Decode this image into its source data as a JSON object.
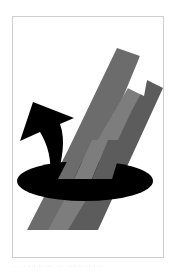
{
  "figure": {
    "colors": {
      "frame_border": "#cfcfcf",
      "bar_dark": "#5a5a5a",
      "bar_mid": "#6e6e6e",
      "bar_light": "#808080",
      "ellipse": "#000000",
      "arrow": "#000000",
      "background": "#ffffff"
    },
    "elements": {
      "bars": [
        {
          "name": "left-bar",
          "tone": "mid"
        },
        {
          "name": "center-band",
          "tone": "light"
        },
        {
          "name": "right-bar",
          "tone": "dark"
        }
      ],
      "ellipse": {
        "name": "rotation-ellipse"
      },
      "arrow": {
        "name": "curved-rotation-arrow",
        "direction": "up-left"
      }
    }
  },
  "caption": {
    "text": ". . . :.:.:. .:. .:. .:.:.:. .:.:.:."
  }
}
